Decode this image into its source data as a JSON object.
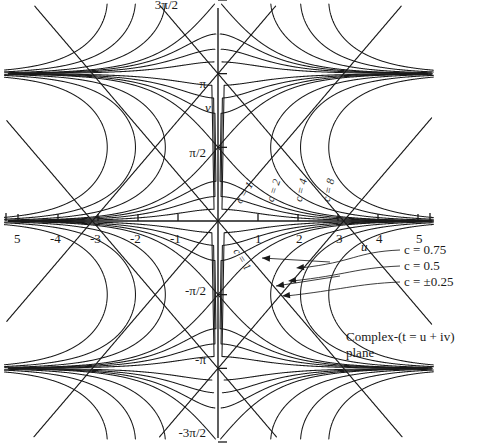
{
  "figure": {
    "caption_line1": "Complex-(t = u + iv)",
    "caption_line2": "plane",
    "x_axis_label": "u",
    "y_axis_label": "v"
  },
  "chart_data": {
    "type": "line",
    "xlabel": "u",
    "ylabel": "v",
    "xlim": [
      -5.3,
      5.3
    ],
    "ylim": [
      -4.712,
      4.712
    ],
    "grid": false,
    "legend_position": "right-middle",
    "x_ticks": [
      -5,
      -4,
      -3,
      -2,
      -1,
      1,
      2,
      3,
      4,
      5
    ],
    "x_tick_labels": [
      "5",
      "-4",
      "-3",
      "-2",
      "-1",
      "1",
      "2",
      "3",
      "4",
      "5"
    ],
    "y_ticks": [
      4.712,
      3.1416,
      1.5708,
      -1.5708,
      -3.1416,
      -4.712
    ],
    "y_tick_labels": [
      "3π/2",
      "π",
      "π/2",
      "-π/2",
      "-π",
      "-3π/2"
    ],
    "curve_family": "level curves of constant c in the complex t-plane",
    "curve_labels": [
      {
        "text": "c = 1",
        "u": 1.08,
        "v": 0.95,
        "rotation": -58
      },
      {
        "text": "c = 2",
        "u": 1.72,
        "v": 1.02,
        "rotation": -72
      },
      {
        "text": "c = 4",
        "u": 2.42,
        "v": 1.02,
        "rotation": -76
      },
      {
        "text": "c = 8",
        "u": 3.1,
        "v": 1.02,
        "rotation": -78
      },
      {
        "text": "c = 1",
        "u": 1.08,
        "v": -0.95,
        "rotation": 58
      }
    ],
    "legend_entries": [
      {
        "label": "c = 0.75",
        "c": 0.75
      },
      {
        "label": "c = 0.5",
        "c": 0.5
      },
      {
        "label": "c = ±0.25",
        "c": 0.25
      }
    ],
    "series": [
      {
        "name": "c = 8",
        "c": 8
      },
      {
        "name": "c = 4",
        "c": 4
      },
      {
        "name": "c = 2",
        "c": 2
      },
      {
        "name": "c = 1",
        "c": 1
      },
      {
        "name": "c = 0.75",
        "c": 0.75
      },
      {
        "name": "c = 0.5",
        "c": 0.5
      },
      {
        "name": "c = 0.25",
        "c": 0.25
      }
    ]
  },
  "tick_labels": {
    "x": {
      "m5": "5",
      "m4": "-4",
      "m3": "-3",
      "m2": "-2",
      "m1": "-1",
      "p1": "1",
      "p2": "2",
      "p3": "3",
      "p4": "4",
      "p5": "5"
    },
    "y": {
      "p3pi2": "3π/2",
      "ppi": "π",
      "ppi2": "π/2",
      "mpi2": "-π/2",
      "mpi": "-π",
      "m3pi2": "-3π/2"
    }
  },
  "curve_labels": {
    "c1_upper": "c = 1",
    "c2": "c = 2",
    "c4": "c = 4",
    "c8": "c = 8",
    "c1_lower": "c = 1"
  },
  "legend": {
    "e075": "c = 0.75",
    "e05": "c = 0.5",
    "e025": "c = ±0.25"
  },
  "colors": {
    "curve": "#1a1a1a",
    "axis": "#1a1a1a",
    "background": "#ffffff"
  }
}
